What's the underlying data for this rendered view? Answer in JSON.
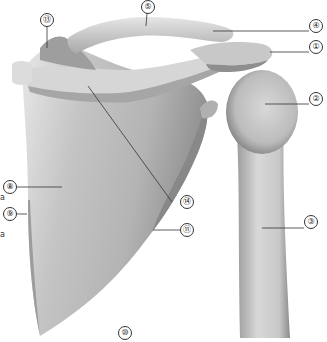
{
  "figure": {
    "colors": {
      "background": "#ffffff",
      "bone_light": "#e4e4e4",
      "bone_mid": "#bdbdbd",
      "bone_dark": "#8a8a8a",
      "leader": "#333333"
    }
  },
  "callouts": [
    {
      "id": "c1",
      "label": "①",
      "x": 309,
      "y": 47,
      "line": [
        270,
        52,
        309,
        52
      ]
    },
    {
      "id": "c2",
      "label": "②",
      "x": 309,
      "y": 99,
      "line": [
        265,
        104,
        309,
        104
      ]
    },
    {
      "id": "c3",
      "label": "③",
      "x": 304,
      "y": 222,
      "line": [
        262,
        228,
        304,
        228
      ]
    },
    {
      "id": "c4",
      "label": "④",
      "x": 309,
      "y": 25,
      "line": [
        213,
        31,
        309,
        31
      ]
    },
    {
      "id": "c5",
      "label": "⑤",
      "x": 141,
      "y": 0,
      "line": [
        147,
        13,
        146,
        26
      ]
    },
    {
      "id": "c8",
      "label": "⑧",
      "x": 3,
      "y": 180,
      "line": [
        17,
        187,
        62,
        187
      ]
    },
    {
      "id": "c9",
      "label": "⑨",
      "x": 3,
      "y": 208,
      "line": [
        17,
        214,
        27,
        214
      ]
    },
    {
      "id": "c10",
      "label": "⑩",
      "x": 118,
      "y": 329,
      "line": null
    },
    {
      "id": "c11",
      "label": "⑪",
      "x": 180,
      "y": 223,
      "line": [
        153,
        230,
        180,
        230
      ]
    },
    {
      "id": "c13",
      "label": "⑬",
      "x": 40,
      "y": 13,
      "line": [
        47,
        27,
        47,
        48
      ]
    },
    {
      "id": "c14",
      "label": "⑭",
      "x": 180,
      "y": 196,
      "line": [
        88,
        86,
        172,
        202
      ]
    }
  ],
  "edge_fragments": [
    {
      "text": "a",
      "x": 0,
      "y": 193
    },
    {
      "text": "a",
      "x": 0,
      "y": 230
    }
  ]
}
